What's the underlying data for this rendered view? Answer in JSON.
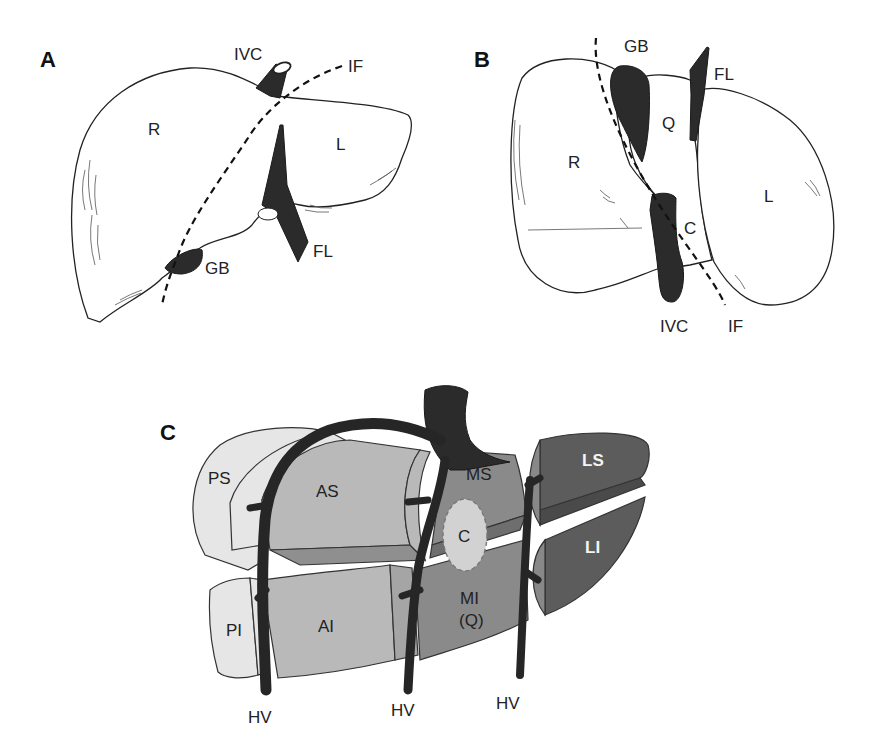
{
  "figure": {
    "panels": [
      {
        "id": "A",
        "letter": "A",
        "view": "anterior liver surface",
        "labels": {
          "ivc": "IVC",
          "if": "IF",
          "right": "R",
          "left": "L",
          "gb": "GB",
          "fl": "FL"
        }
      },
      {
        "id": "B",
        "letter": "B",
        "view": "inferior (visceral) liver surface",
        "labels": {
          "gb": "GB",
          "fl": "FL",
          "q": "Q",
          "right": "R",
          "left": "L",
          "c": "C",
          "ivc": "IVC",
          "if": "IF"
        }
      },
      {
        "id": "C",
        "letter": "C",
        "view": "segmental anatomy with hepatic veins",
        "labels": {
          "ps": "PS",
          "as": "AS",
          "ms": "MS",
          "ls": "LS",
          "li": "LI",
          "c": "C",
          "pi": "PI",
          "ai": "AI",
          "mi": "MI",
          "mi_q": "(Q)",
          "hv1": "HV",
          "hv2": "HV",
          "hv3": "HV"
        },
        "colors": {
          "posterior": "#e6e6e6",
          "anterior": "#b9b9b9",
          "anterior_shadow": "#8f8f8f",
          "medial": "#8a8a8a",
          "lateral": "#5c5c5c",
          "caudate": "#d2d2d2",
          "vein": "#262626"
        }
      }
    ]
  }
}
